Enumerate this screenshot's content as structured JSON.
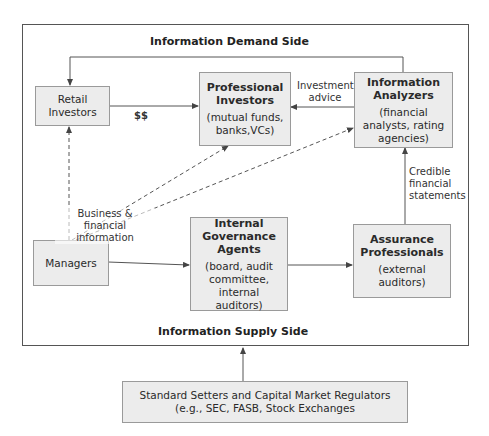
{
  "diagram": {
    "demand_side_label": "Information Demand Side",
    "supply_side_label": "Information Supply Side",
    "nodes": {
      "retail_investors": {
        "title": "Retail Investors"
      },
      "professional_investors": {
        "title": "Professional Investors",
        "sub": "(mutual funds, banks,VCs)"
      },
      "information_analyzers": {
        "title": "Information Analyzers",
        "sub": "(financial analysts, rating agencies)"
      },
      "managers": {
        "title": "Managers"
      },
      "internal_governance": {
        "title": "Internal Governance Agents",
        "sub": "(board, audit committee, internal auditors)"
      },
      "assurance_professionals": {
        "title": "Assurance Professionals",
        "sub": "(external auditors)"
      },
      "standard_setters": {
        "title": "Standard Setters and Capital Market Regulators",
        "sub": "(e.g., SEC, FASB, Stock Exchanges"
      }
    },
    "edge_labels": {
      "money": "$$",
      "investment_advice": "Investment advice",
      "business_financial_info": "Business & financial information",
      "credible_statements": "Credible financial statements"
    },
    "colors": {
      "box_fill": "#ececec",
      "box_border": "#9a9a9a",
      "line": "#555555"
    }
  }
}
